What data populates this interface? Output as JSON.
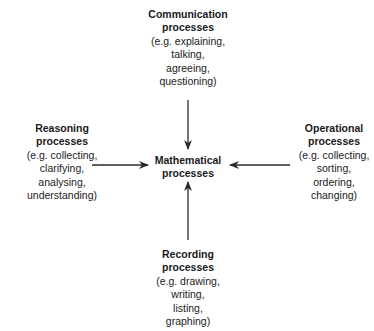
{
  "diagram": {
    "center": {
      "title_lines": [
        "Mathematical",
        "processes"
      ]
    },
    "nodes": [
      {
        "id": "communication",
        "position": "top",
        "title_lines": [
          "Communication",
          "processes"
        ],
        "detail_lines": [
          "(e.g. explaining,",
          "talking,",
          "agreeing,",
          "questioning)"
        ]
      },
      {
        "id": "reasoning",
        "position": "left",
        "title_lines": [
          "Reasoning",
          "processes"
        ],
        "detail_lines": [
          "(e.g. collecting,",
          "clarifying,",
          "analysing,",
          "understanding)"
        ]
      },
      {
        "id": "operational",
        "position": "right",
        "title_lines": [
          "Operational",
          "processes"
        ],
        "detail_lines": [
          "(e.g. collecting,",
          "sorting,",
          "ordering,",
          "changing)"
        ]
      },
      {
        "id": "recording",
        "position": "bottom",
        "title_lines": [
          "Recording",
          "processes"
        ],
        "detail_lines": [
          "(e.g. drawing,",
          "writing,",
          "listing,",
          "graphing)"
        ]
      }
    ],
    "edges": [
      {
        "from": "communication",
        "to": "center",
        "direction": "down"
      },
      {
        "from": "reasoning",
        "to": "center",
        "direction": "right"
      },
      {
        "from": "operational",
        "to": "center",
        "direction": "left"
      },
      {
        "from": "recording",
        "to": "center",
        "direction": "up"
      }
    ],
    "colors": {
      "text": "#1a1a1a",
      "arrow": "#2a2a2a",
      "background": "#ffffff"
    }
  }
}
